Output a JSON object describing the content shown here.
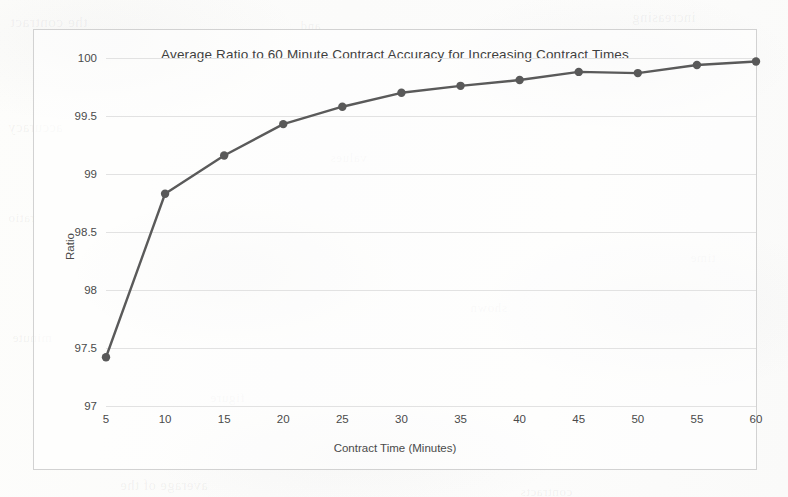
{
  "chart_data": {
    "type": "line",
    "title": "Average Ratio to 60 Minute Contract Accuracy for Increasing Contract Times",
    "xlabel": "Contract Time (Minutes)",
    "ylabel": "Ratio",
    "x": [
      5,
      10,
      15,
      20,
      25,
      30,
      35,
      40,
      45,
      50,
      55,
      60
    ],
    "values": [
      97.42,
      98.83,
      99.16,
      99.43,
      99.58,
      99.7,
      99.76,
      99.81,
      99.88,
      99.87,
      99.94,
      99.97
    ],
    "series": [
      {
        "name": "Average Ratio",
        "values": [
          97.42,
          98.83,
          99.16,
          99.43,
          99.58,
          99.7,
          99.76,
          99.81,
          99.88,
          99.87,
          99.94,
          99.97
        ]
      }
    ],
    "xtick_labels": [
      "5",
      "10",
      "15",
      "20",
      "25",
      "30",
      "35",
      "40",
      "45",
      "50",
      "55",
      "60"
    ],
    "ytick_labels": [
      "97",
      "97.5",
      "98",
      "98.5",
      "99",
      "99.5",
      "100"
    ],
    "yticks": [
      97,
      97.5,
      98,
      98.5,
      99,
      99.5,
      100
    ],
    "ylim": [
      97,
      100
    ],
    "xlim": [
      5,
      60
    ],
    "grid": "horizontal",
    "legend": "none",
    "marker": "circle",
    "line_color": "#5a5a5a",
    "marker_color": "#595959",
    "grid_color": "#e2e2e2",
    "text_color": "#4a4a4a",
    "frame_color": "#d2d2d2",
    "background_color": "#fdfdfc"
  },
  "background_bleed": [
    {
      "text": "the contract",
      "left": 10,
      "top": 14,
      "size": 15
    },
    {
      "text": "increasing",
      "left": 632,
      "top": 10,
      "size": 14
    },
    {
      "text": "and",
      "left": 300,
      "top": 18,
      "size": 13
    },
    {
      "text": "accuracy",
      "left": 8,
      "top": 120,
      "size": 14
    },
    {
      "text": "ratio",
      "left": 8,
      "top": 210,
      "size": 13
    },
    {
      "text": "minute",
      "left": 12,
      "top": 330,
      "size": 13
    },
    {
      "text": "time",
      "left": 690,
      "top": 250,
      "size": 13
    },
    {
      "text": "average of the",
      "left": 120,
      "top": 478,
      "size": 14
    },
    {
      "text": "contracts",
      "left": 520,
      "top": 484,
      "size": 13
    },
    {
      "text": "values",
      "left": 330,
      "top": 150,
      "size": 13
    },
    {
      "text": "shown",
      "left": 470,
      "top": 300,
      "size": 13
    },
    {
      "text": "figure",
      "left": 210,
      "top": 390,
      "size": 13
    }
  ]
}
